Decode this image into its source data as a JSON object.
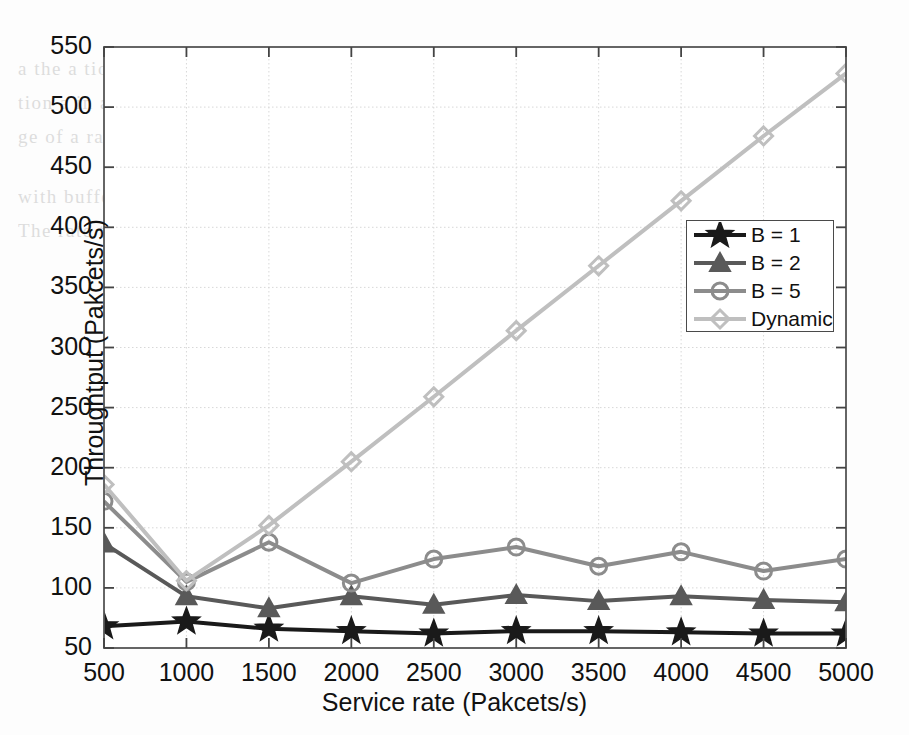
{
  "chart_data": {
    "type": "line",
    "title": "",
    "xlabel": "Service rate (Pakcets/s)",
    "ylabel": "Throughtput (Pakcets/s)",
    "x": [
      500,
      1000,
      1500,
      2000,
      2500,
      3000,
      3500,
      4000,
      4500,
      5000
    ],
    "categories": [
      "500",
      "1000",
      "1500",
      "2000",
      "2500",
      "3000",
      "3500",
      "4000",
      "4500",
      "5000"
    ],
    "xlim": [
      500,
      5000
    ],
    "ylim": [
      50,
      550
    ],
    "xticks": [
      500,
      1000,
      1500,
      2000,
      2500,
      3000,
      3500,
      4000,
      4500,
      5000
    ],
    "yticks": [
      50,
      100,
      150,
      200,
      250,
      300,
      350,
      400,
      450,
      500,
      550
    ],
    "grid": true,
    "legend_position": "center-right",
    "series": [
      {
        "name": "B = 1",
        "marker": "star",
        "color": "#1a1a1a",
        "values": [
          68,
          72,
          66,
          64,
          62,
          64,
          64,
          63,
          62,
          62
        ]
      },
      {
        "name": "B = 2",
        "marker": "triangle",
        "color": "#595959",
        "values": [
          137,
          93,
          83,
          93,
          86,
          94,
          89,
          93,
          90,
          88
        ]
      },
      {
        "name": "B = 5",
        "marker": "circle",
        "color": "#8c8c8c",
        "values": [
          172,
          105,
          138,
          104,
          124,
          134,
          118,
          130,
          114,
          124
        ]
      },
      {
        "name": "Dynamic",
        "marker": "diamond",
        "color": "#bfbfbf",
        "values": [
          186,
          106,
          152,
          205,
          259,
          314,
          368,
          422,
          476,
          528
        ]
      }
    ]
  },
  "axis": {
    "y_tick_labels": [
      "550",
      "500",
      "450",
      "400",
      "350",
      "300",
      "250",
      "200",
      "150",
      "100",
      "50"
    ],
    "x_tick_labels": [
      "500",
      "1000",
      "1500",
      "2000",
      "2500",
      "3000",
      "3500",
      "4000",
      "4500",
      "5000"
    ]
  },
  "legend": {
    "items": [
      {
        "label": "B = 1"
      },
      {
        "label": "B = 2"
      },
      {
        "label": "B = 5"
      },
      {
        "label": "Dynamic"
      }
    ]
  },
  "background_text": {
    "lines": [
      "a  the  a  tion",
      "tion  a  in  a  an,  1000  and  1500",
      "ge  of  a  rate  of  the",
      "with  buffering  the  a  rate  is  higher",
      "The  rate  the  a  packet  the  a  waiting  time"
    ]
  }
}
